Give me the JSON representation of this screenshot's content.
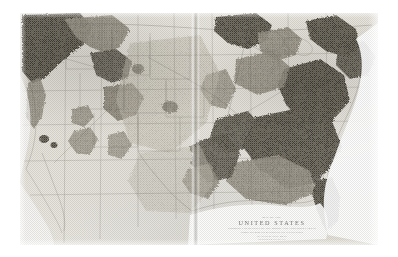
{
  "image": {
    "kind": "photographed-historical-map-plate",
    "subject": "map-of-the-united-states",
    "width": 398,
    "height": 257,
    "background_color": "#ffffff"
  },
  "plate": {
    "left": 20,
    "top": 13,
    "width": 358,
    "height": 232,
    "paper_color": "#e8e6e0",
    "ink_color": "#4a4740",
    "has_center_fold": true,
    "center_fold_x": 175
  },
  "cartouche": {
    "pre_label": "MAP OF THE",
    "title": "UNITED STATES",
    "subtitle": "SHOWING THE DENSITY OF THE WOODLAND AND FOREST AREAS",
    "line_2": "COMPILED FROM THE RETURNS OF THE TENTH CENSUS",
    "line_3": "SCALE OF STATUTE MILES",
    "credit": "JULIUS BIEN & CO. LITH. N.Y."
  },
  "legend": {
    "shading_meaning": "darker stipple indicates denser woodland cover",
    "light_meaning": "open prairie, plains and treeless region",
    "white_meaning": "ocean and large water bodies"
  },
  "colors": {
    "paper": "#e8e6e0",
    "light_shade": "#d8d5cd",
    "mid_shade": "#a9a59b",
    "dark_shade": "#6f6b62",
    "darkest_shade": "#4e4a43",
    "ocean_white": "#fbfaf8",
    "line_ink": "#55514a"
  },
  "regions": [
    {
      "name": "pacific-northwest-forest",
      "density": "dark"
    },
    {
      "name": "northern-rockies-forest",
      "density": "dark"
    },
    {
      "name": "cascade-sierra-forest",
      "density": "mid"
    },
    {
      "name": "central-rockies-forest",
      "density": "mid"
    },
    {
      "name": "colorado-plateau-patch",
      "density": "mid"
    },
    {
      "name": "black-hills-patch",
      "density": "dark"
    },
    {
      "name": "great-plains-open",
      "density": "light"
    },
    {
      "name": "texas-open-prairie",
      "density": "light"
    },
    {
      "name": "east-texas-piney-woods",
      "density": "dark"
    },
    {
      "name": "ozark-forest",
      "density": "dark"
    },
    {
      "name": "great-lakes-north-woods",
      "density": "dark"
    },
    {
      "name": "appalachian-forest",
      "density": "darkest"
    },
    {
      "name": "southeast-coastal-forest",
      "density": "dark"
    },
    {
      "name": "florida-forest",
      "density": "dark"
    },
    {
      "name": "corn-belt-cleared",
      "density": "light"
    }
  ],
  "water": [
    {
      "name": "pacific-ocean"
    },
    {
      "name": "atlantic-ocean"
    },
    {
      "name": "gulf-of-mexico"
    },
    {
      "name": "great-lakes"
    }
  ]
}
